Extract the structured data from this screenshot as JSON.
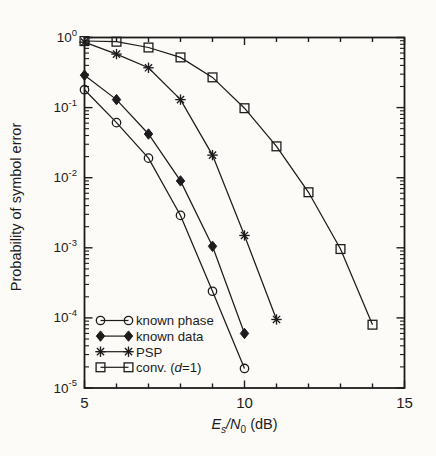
{
  "figure": {
    "background": "#fcfbf8",
    "ink": "#1c1c1c"
  },
  "chart_data": {
    "type": "line",
    "title": "",
    "x_axis": {
      "label_text": "Es/N0 (dB)",
      "label_segments": [
        {
          "t": "E",
          "i": true
        },
        {
          "t": "s",
          "i": true,
          "sub": true
        },
        {
          "t": "/",
          "i": true
        },
        {
          "t": "N",
          "i": true
        },
        {
          "t": "0",
          "sub": true
        },
        {
          "t": " (dB)"
        }
      ],
      "min": 5,
      "max": 15,
      "major_ticks": [
        5,
        10,
        15
      ],
      "tick_labels": [
        "5",
        "10",
        "15"
      ],
      "minor_step": 1
    },
    "y_axis": {
      "label": "Probability of symbol error",
      "scale": "log",
      "tick_exponents": [
        0,
        -1,
        -2,
        -3,
        -4,
        -5
      ]
    },
    "grid": "off",
    "legend": {
      "position": "inside-bottom-left",
      "items": [
        {
          "marker": "circle",
          "label": "known phase",
          "segments": [
            {
              "t": "known phase"
            }
          ]
        },
        {
          "marker": "diamond",
          "label": "known data",
          "segments": [
            {
              "t": "known data"
            }
          ]
        },
        {
          "marker": "asterisk",
          "label": "PSP",
          "segments": [
            {
              "t": "PSP"
            }
          ]
        },
        {
          "marker": "square",
          "label": "conv. (d=1)",
          "segments": [
            {
              "t": "conv. ("
            },
            {
              "t": "d",
              "i": true
            },
            {
              "t": "=1)"
            }
          ]
        }
      ]
    },
    "series": [
      {
        "name": "known phase",
        "marker": "circle",
        "x": [
          5,
          6,
          7,
          8,
          9,
          10
        ],
        "y": [
          0.18,
          0.061,
          0.019,
          0.0029,
          0.00024,
          1.9e-05
        ]
      },
      {
        "name": "known data",
        "marker": "diamond",
        "x": [
          5,
          6,
          7,
          8,
          9,
          10
        ],
        "y": [
          0.29,
          0.13,
          0.042,
          0.009,
          0.00105,
          6e-05
        ]
      },
      {
        "name": "PSP",
        "marker": "asterisk",
        "x": [
          5,
          6,
          7,
          8,
          9,
          10,
          11
        ],
        "y": [
          0.86,
          0.58,
          0.37,
          0.13,
          0.021,
          0.0015,
          9.5e-05
        ]
      },
      {
        "name": "conv. (d=1)",
        "marker": "square",
        "x": [
          5,
          6,
          7,
          8,
          9,
          10,
          11,
          12,
          13,
          14
        ],
        "y": [
          0.89,
          0.87,
          0.72,
          0.52,
          0.27,
          0.098,
          0.028,
          0.0062,
          0.00096,
          8e-05
        ]
      }
    ]
  }
}
